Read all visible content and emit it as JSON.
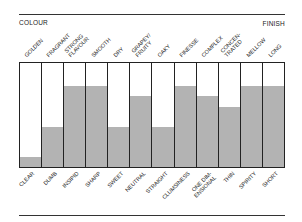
{
  "chart_data": {
    "type": "bar",
    "title": "",
    "left_label_top": "COLOUR",
    "right_label_top": "FINISH",
    "categories_top": [
      "GOLDEN",
      "FRAGRANT",
      "STRONG\nFLAVOUR",
      "SMOOTH",
      "DRY",
      "GRAPEY/\nFRUITY",
      "OAKY",
      "FINESSE",
      "COMPLEX",
      "CONCEN-\nTRATED",
      "MELLOW",
      "LONG"
    ],
    "categories_bottom": [
      "CLEAR",
      "DUMB",
      "INSIPID",
      "SHARP",
      "SWEET",
      "NEUTRAL",
      "STRAIGHT",
      "CLUMSINESS",
      "ONE DIM-\nENSIONAL",
      "THIN",
      "SPIRITY",
      "SHORT"
    ],
    "series": [
      {
        "name": "level (fraction toward bottom descriptor)",
        "values": [
          0.1,
          0.38,
          0.78,
          0.78,
          0.38,
          0.68,
          0.38,
          0.78,
          0.68,
          0.58,
          0.78,
          0.78
        ]
      }
    ],
    "ylim": [
      0,
      1
    ],
    "grid": false,
    "legend": "none",
    "colors": {
      "fill": "#b3b3b3",
      "empty": "#ffffff",
      "border": "#222222"
    }
  }
}
